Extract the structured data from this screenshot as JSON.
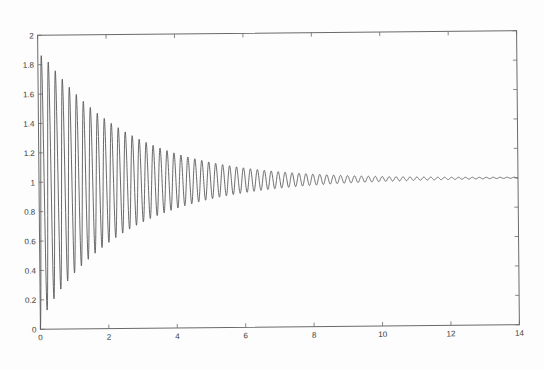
{
  "chart_data": {
    "type": "line",
    "title": "",
    "xlabel": "",
    "ylabel": "",
    "xlim": [
      0,
      14
    ],
    "ylim": [
      0,
      2
    ],
    "grid": false,
    "legend": null,
    "x_ticks": [
      0,
      2,
      4,
      6,
      8,
      10,
      12,
      14
    ],
    "x_tick_labels": [
      "0",
      "2",
      "4",
      "6",
      "8",
      "10",
      "12",
      "14"
    ],
    "y_ticks": [
      0,
      0.2,
      0.4,
      0.6,
      0.8,
      1,
      1.2,
      1.4,
      1.6,
      1.8,
      2
    ],
    "y_tick_labels": [
      "0",
      "0.2",
      "0.4",
      "0.6",
      "0.8",
      "1",
      "1.2",
      "1.4",
      "1.6",
      "1.8",
      "2"
    ],
    "model": {
      "formula": "y = 1 - exp(-sigma*t) * cos(omega*t)",
      "final_value": 1,
      "sigma": 0.4,
      "omega": 31.0,
      "overshoot_scale": 0.93,
      "t_start": 0,
      "t_end": 14,
      "samples": 2800
    },
    "series": [
      {
        "name": "response",
        "color": "#5a5a5a",
        "envelope_samples": {
          "t": [
            0.05,
            1,
            2,
            3,
            4,
            5,
            6,
            7,
            8,
            9,
            10,
            12,
            14
          ],
          "peak": [
            1.92,
            1.62,
            1.42,
            1.29,
            1.19,
            1.13,
            1.09,
            1.06,
            1.04,
            1.03,
            1.02,
            1.01,
            1.0
          ],
          "trough": [
            0.0,
            0.38,
            0.58,
            0.71,
            0.81,
            0.87,
            0.91,
            0.94,
            0.96,
            0.97,
            0.98,
            0.99,
            1.0
          ]
        }
      }
    ]
  },
  "figure": {
    "background": "#ffffff",
    "axis_color": "#6a6a6a",
    "line_color": "#5a5a5a"
  }
}
